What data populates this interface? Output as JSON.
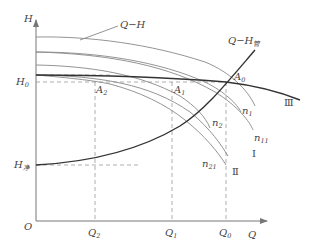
{
  "diagram": {
    "axes": {
      "y_label": "H",
      "x_label": "Q",
      "origin_label": "O"
    },
    "y_ticks": [
      {
        "main": "H",
        "sub": "0",
        "y": 82
      },
      {
        "main": "H",
        "sub": "净",
        "y": 165
      }
    ],
    "x_ticks": [
      {
        "main": "Q",
        "sub": "2",
        "x": 95
      },
      {
        "main": "Q",
        "sub": "1",
        "x": 172
      },
      {
        "main": "Q",
        "sub": "0",
        "x": 226
      }
    ],
    "curve_labels": {
      "pump_curve": {
        "text": "Q−H"
      },
      "system_curve": {
        "main": "Q−H",
        "sub": "管"
      },
      "throttled_curve": {
        "text": "Ⅲ"
      },
      "curve_I": {
        "text": "Ⅰ"
      },
      "curve_II": {
        "text": "Ⅱ"
      },
      "n1": {
        "main": "n",
        "sub": "1"
      },
      "n2": {
        "main": "n",
        "sub": "2"
      },
      "n11": {
        "main": "n",
        "sub": "11"
      },
      "n21": {
        "main": "n",
        "sub": "21"
      }
    },
    "points": {
      "A0": {
        "main": "A",
        "sub": "0"
      },
      "A1": {
        "main": "A",
        "sub": "1"
      },
      "A2": {
        "main": "A",
        "sub": "2"
      }
    }
  }
}
